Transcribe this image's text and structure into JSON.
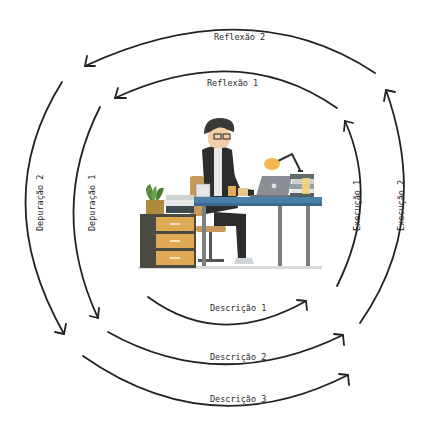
{
  "diagram": {
    "type": "iterative-cycle",
    "center_illustration": "person-working-at-desk",
    "labels": {
      "reflexao_2": "Reflexão 2",
      "reflexao_1": "Reflexão 1",
      "depuracao_2": "Depuração 2",
      "depuracao_1": "Depuração 1",
      "execucao_1": "Execução 1",
      "execucao_2": "Execução 2",
      "descricao_1": "Descrição 1",
      "descricao_2": "Descrição 2",
      "descricao_3": "Descrição 3"
    },
    "colors": {
      "arrow": "#222222",
      "desk_top": "#4a7fa8",
      "drawer": "#e0a955",
      "cabinet": "#4a4a40",
      "suit": "#2b2d2f",
      "lamp": "#f2b84b",
      "laptop": "#8a8f96",
      "plant": "#5a8a3c"
    }
  }
}
